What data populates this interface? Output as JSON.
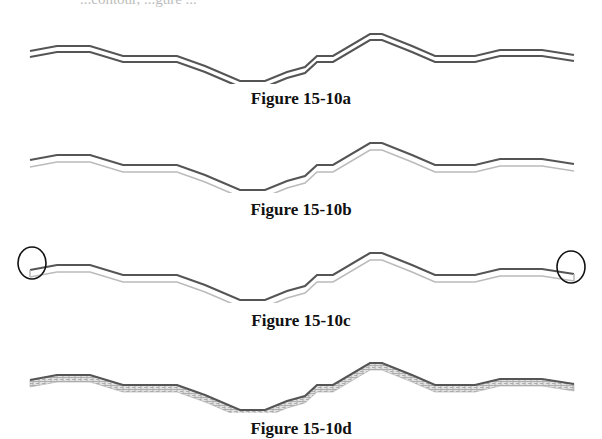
{
  "page": {
    "top_fragment": "...contour, ...gure ..."
  },
  "figures": [
    {
      "id": "a",
      "caption": "Figure 15-10a",
      "style": "double-line",
      "description": "Two parallel dark offset lines"
    },
    {
      "id": "b",
      "caption": "Figure 15-10b",
      "style": "dark-top-light-offset",
      "description": "Dark top line with light gray offset line below"
    },
    {
      "id": "c",
      "caption": "Figure 15-10c",
      "style": "closed-ends-circled",
      "description": "Dark top line with light offset, ends joined and circled"
    },
    {
      "id": "d",
      "caption": "Figure 15-10d",
      "style": "hatched-band",
      "description": "Dark top line with hatched fill band between offsets"
    }
  ],
  "geometry": {
    "points": [
      [
        30,
        17
      ],
      [
        57,
        12
      ],
      [
        90,
        12
      ],
      [
        123,
        22
      ],
      [
        177,
        22
      ],
      [
        205,
        32
      ],
      [
        240,
        47
      ],
      [
        265,
        47
      ],
      [
        287,
        38
      ],
      [
        305,
        33
      ],
      [
        317,
        22
      ],
      [
        333,
        22
      ],
      [
        370,
        0
      ],
      [
        382,
        0
      ],
      [
        412,
        12
      ],
      [
        435,
        22
      ],
      [
        475,
        22
      ],
      [
        500,
        16
      ],
      [
        542,
        16
      ],
      [
        574,
        21
      ]
    ],
    "offset": 6
  },
  "colors": {
    "dark_line": "#555555",
    "light_line": "#bbbbbb",
    "hatch": "#9a9a9a",
    "circle": "#111111"
  }
}
